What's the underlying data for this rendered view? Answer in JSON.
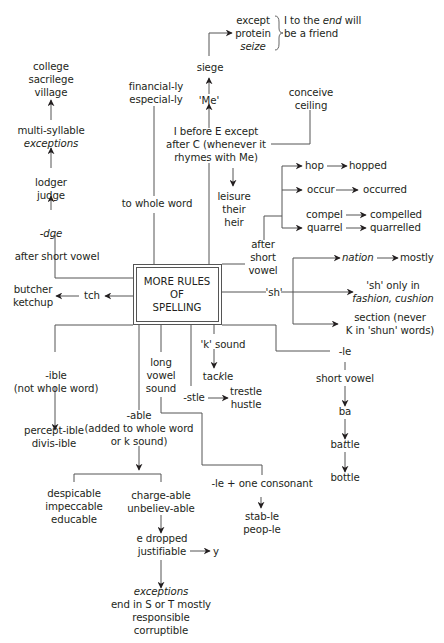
{
  "title": {
    "line1": "MORE RULES",
    "line2": "OF",
    "line3": "SPELLING"
  },
  "ie_branch": {
    "rule_l1": "I before E except",
    "rule_l2": "after C (whenever it",
    "rule_l3": "rhymes with Me)",
    "me": "'Me'",
    "siege": "siege",
    "except_l1": "except",
    "except_l2": "protein",
    "except_l3": "seize",
    "friend_l1a": "I to the ",
    "friend_l1b": "end",
    "friend_l1c": " will",
    "friend_l2": "be a friend",
    "conceive": "conceive",
    "ceiling": "ceiling",
    "leisure": "leisure",
    "their": "their",
    "heir": "heir"
  },
  "ly_branch": {
    "to_whole_word": "to whole word",
    "financially": "financial-ly",
    "especially": "especial-ly"
  },
  "dge_branch": {
    "after_short_vowel": "after short vowel",
    "dge": "-dge",
    "lodger": "lodger",
    "judge": "judge",
    "multi_syllable": "multi-syllable",
    "exceptions": "exceptions",
    "college": "college",
    "sacrilege": "sacrilege",
    "village": "village"
  },
  "tch_branch": {
    "tch": "tch",
    "butcher": "butcher",
    "ketchup": "ketchup"
  },
  "doubling_branch": {
    "after": "after",
    "short": "short",
    "vowel": "vowel",
    "rows": [
      {
        "from": "hop",
        "to": "hopped"
      },
      {
        "from": "occur",
        "to": "occurred"
      },
      {
        "from": "compel",
        "to": "compelled"
      },
      {
        "from": "quarrel",
        "to": "quarrelled"
      }
    ]
  },
  "sh_branch": {
    "sh": "'sh'",
    "nation": "nation",
    "mostly": "mostly",
    "sh_only_l1": "'sh' only in",
    "sh_only_l2": "fashion, cushion",
    "section_l1": "section (never",
    "section_l2": "K in 'shun' words)"
  },
  "le_branch": {
    "le": "-le",
    "short_vowel": "short vowel",
    "ba": "ba",
    "battle_a": "ba",
    "battle_b": "t",
    "battle_c": "tle",
    "bottle": "bottle"
  },
  "k_branch": {
    "k_sound": "'k' sound",
    "tackle_a": "tac",
    "tackle_b": "k",
    "tackle_c": "le"
  },
  "stle_branch": {
    "stle": "-stle",
    "trestle": "trestle",
    "hustle": "hustle"
  },
  "long_vowel_branch": {
    "long": "long",
    "vowel": "vowel",
    "sound": "sound",
    "le_one_consonant": "-le + one consonant",
    "stable": "stab-le",
    "people": "peop-le"
  },
  "ible_branch": {
    "ible": "-ible",
    "not_whole_word": "(not whole word)",
    "perceptible": "percept-ible",
    "divisible": "divis-ible"
  },
  "able_branch": {
    "able": "-able",
    "added_l1": "(added to whole word",
    "added_l2": "or k sound)",
    "despicable": "despicable",
    "impeccable": "impeccable",
    "educable": "educable",
    "chargeable": "charge-able",
    "unbelievable": "unbeliev-able",
    "e_dropped": "e dropped",
    "justifiable": "justifiable",
    "y": "y",
    "exceptions": "exceptions",
    "end_in": "end in S or T mostly",
    "responsible": "responsible",
    "corruptible": "corruptible"
  },
  "colors": {
    "line": "#555555",
    "text": "#231f20",
    "arrow": "#231f20"
  }
}
